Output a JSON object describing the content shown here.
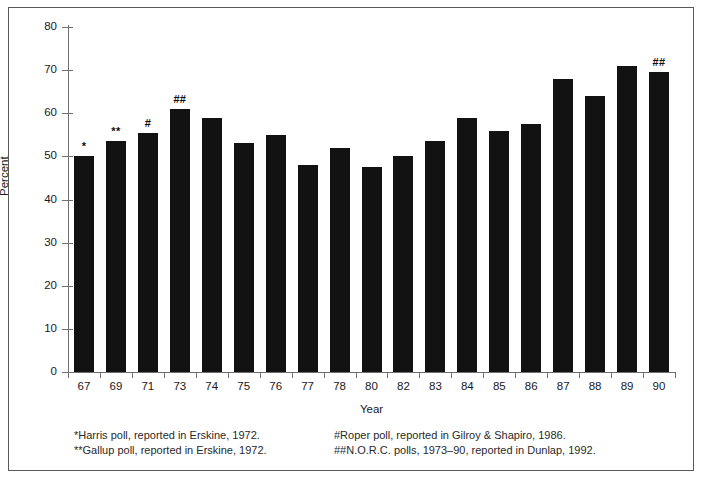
{
  "chart_data": {
    "type": "bar",
    "title": "",
    "xlabel": "Year",
    "ylabel": "Percent",
    "ylim": [
      0,
      80
    ],
    "yticks": [
      0,
      10,
      20,
      30,
      40,
      50,
      60,
      70,
      80
    ],
    "grid": false,
    "legend": "none",
    "categories": [
      "67",
      "69",
      "71",
      "73",
      "74",
      "75",
      "76",
      "77",
      "78",
      "80",
      "82",
      "83",
      "84",
      "85",
      "86",
      "87",
      "88",
      "89",
      "90"
    ],
    "values": [
      50,
      53.5,
      55.5,
      61,
      59,
      53,
      55,
      48,
      52,
      47.5,
      50,
      53.5,
      59,
      56,
      57.5,
      68,
      64,
      71,
      69.5
    ],
    "point_annotations": [
      {
        "category": "67",
        "text": "*"
      },
      {
        "category": "69",
        "text": "**"
      },
      {
        "category": "71",
        "text": "#"
      },
      {
        "category": "73",
        "text": "##"
      },
      {
        "category": "90",
        "text": "##"
      }
    ]
  },
  "axes": {
    "y_label": "Percent",
    "x_label": "Year",
    "y_tick_labels": [
      "80",
      "70",
      "60",
      "50",
      "40",
      "30",
      "20",
      "10",
      "0"
    ],
    "x_tick_labels": [
      "67",
      "69",
      "71",
      "73",
      "74",
      "75",
      "76",
      "77",
      "78",
      "80",
      "82",
      "83",
      "84",
      "85",
      "86",
      "87",
      "88",
      "89",
      "90"
    ]
  },
  "footnotes": {
    "left": [
      "*Harris poll, reported in Erskine, 1972.",
      "**Gallup poll, reported in Erskine, 1972."
    ],
    "right": [
      "#Roper poll, reported in Gilroy & Shapiro, 1986.",
      "##N.O.R.C. polls, 1973–90, reported in Dunlap, 1992."
    ]
  },
  "colors": {
    "bar": "#121212",
    "axis": "#6e6e6e",
    "text": "#1a1a1a",
    "frame": "#5a5a5a",
    "background": "#ffffff"
  }
}
